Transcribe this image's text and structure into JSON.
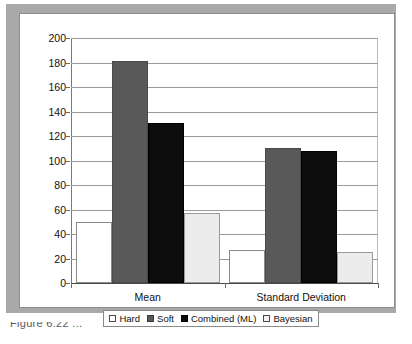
{
  "figure": {
    "caption_fragment": "Figure 6.22  ..."
  },
  "chart_data": {
    "type": "bar",
    "title": "",
    "xlabel": "",
    "ylabel": "",
    "categories": [
      "Mean",
      "Standard Deviation"
    ],
    "series": [
      {
        "name": "Hard",
        "color": "#ffffff",
        "values": [
          50,
          27
        ]
      },
      {
        "name": "Soft",
        "color": "#595959",
        "values": [
          181,
          110
        ]
      },
      {
        "name": "Combined (ML)",
        "color": "#0d0d0d",
        "values": [
          131,
          108
        ]
      },
      {
        "name": "Bayesian",
        "color": "#ececec",
        "values": [
          57,
          25
        ]
      }
    ],
    "ylim": [
      0,
      200
    ],
    "ytick_step": 20,
    "yticks": [
      200,
      180,
      160,
      140,
      120,
      100,
      80,
      60,
      40,
      20,
      0
    ],
    "ytick_labels": [
      "200",
      "180",
      "160",
      "140",
      "120",
      "100",
      "80",
      "60",
      "40",
      "20",
      "0"
    ],
    "grid": true,
    "grid_axis": "y",
    "legend_position": "bottom",
    "legend_entries": [
      "Hard",
      "Soft",
      "Combined (ML)",
      "Bayesian"
    ]
  },
  "colors": {
    "frame": "#a9a9a9",
    "gridline": "#9a9a9a",
    "axis": "#4a4a4a",
    "text": "#111111"
  }
}
